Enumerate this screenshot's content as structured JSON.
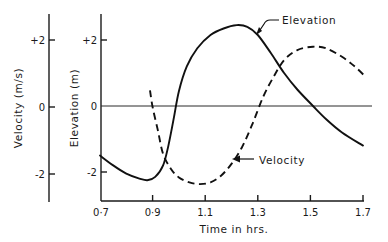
{
  "chart_data": {
    "type": "line",
    "title": "",
    "xlabel": "Time in hrs.",
    "xlim": [
      0.7,
      1.7
    ],
    "x_ticks": [
      0.7,
      0.9,
      1.1,
      1.3,
      1.5,
      1.7
    ],
    "x_tick_labels": [
      "0·7",
      "0·9",
      "1.1",
      "1.3",
      "1.5",
      "1.7"
    ],
    "y_axes": [
      {
        "id": "elevation",
        "label": "Elevation (m)",
        "lim": [
          -2.8,
          2.8
        ],
        "ticks": [
          2,
          0,
          -2
        ],
        "tick_labels": [
          "+2",
          "0",
          "-2"
        ]
      },
      {
        "id": "velocity",
        "label": "Velocity (m/s)",
        "lim": [
          -2.8,
          2.8
        ],
        "ticks": [
          2,
          0,
          -2
        ],
        "tick_labels": [
          "+2",
          "0",
          "-2"
        ]
      }
    ],
    "grid": false,
    "zero_line": true,
    "series": [
      {
        "name": "Elevation",
        "axis": "elevation",
        "style": "solid",
        "x": [
          0.7,
          0.75,
          0.8,
          0.85,
          0.88,
          0.91,
          0.94,
          0.96,
          0.98,
          1.0,
          1.03,
          1.07,
          1.12,
          1.17,
          1.22,
          1.26,
          1.3,
          1.35,
          1.4,
          1.45,
          1.51,
          1.56,
          1.62,
          1.7
        ],
        "values": [
          -1.5,
          -1.8,
          -2.05,
          -2.2,
          -2.25,
          -2.15,
          -1.8,
          -1.2,
          -0.4,
          0.45,
          1.2,
          1.75,
          2.15,
          2.35,
          2.45,
          2.4,
          2.15,
          1.6,
          1.0,
          0.5,
          0.0,
          -0.4,
          -0.8,
          -1.2
        ]
      },
      {
        "name": "Velocity",
        "axis": "velocity",
        "style": "dashed",
        "x": [
          0.89,
          0.9,
          0.92,
          0.94,
          0.97,
          1.0,
          1.04,
          1.08,
          1.12,
          1.16,
          1.2,
          1.24,
          1.28,
          1.32,
          1.36,
          1.4,
          1.45,
          1.51,
          1.56,
          1.62,
          1.67,
          1.71
        ],
        "values": [
          0.5,
          0.0,
          -0.7,
          -1.4,
          -1.85,
          -2.1,
          -2.25,
          -2.3,
          -2.25,
          -2.05,
          -1.7,
          -1.2,
          -0.5,
          0.3,
          0.9,
          1.4,
          1.7,
          1.8,
          1.75,
          1.5,
          1.2,
          0.9
        ]
      }
    ],
    "annotations": [
      {
        "text": "Elevation",
        "points_to_series": "Elevation",
        "at_x": 1.3
      },
      {
        "text": "Velocity",
        "points_to_series": "Velocity",
        "at_x": 1.2
      }
    ],
    "legend": "none"
  }
}
